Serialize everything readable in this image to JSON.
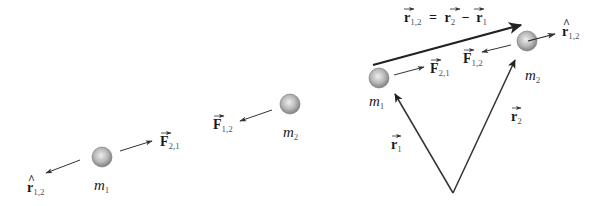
{
  "left_panel": {
    "mass1_label": "m",
    "mass1_sub": "1",
    "mass2_label": "m",
    "mass2_sub": "2",
    "force21_label": "F",
    "force21_sub": "2,1",
    "force12_label": "F",
    "force12_sub": "1,2",
    "unit_vector_label": "r",
    "unit_vector_sub": "1,2"
  },
  "right_panel": {
    "equation": {
      "lhs": "r",
      "lhs_sub": "1,2",
      "equals": "=",
      "term1": "r",
      "term1_sub": "2",
      "minus": "−",
      "term2": "r",
      "term2_sub": "1"
    },
    "mass1_label": "m",
    "mass1_sub": "1",
    "mass2_label": "m",
    "mass2_sub": "2",
    "force21_label": "F",
    "force21_sub": "2,1",
    "force12_label": "F",
    "force12_sub": "1,2",
    "unit_vector_label": "r",
    "unit_vector_sub": "1,2",
    "position1_label": "r",
    "position1_sub": "1",
    "position2_label": "r",
    "position2_sub": "2"
  },
  "colors": {
    "arrow": "#333333",
    "ball_light": "#e6e6e6",
    "ball_dark": "#8a8a8a"
  }
}
